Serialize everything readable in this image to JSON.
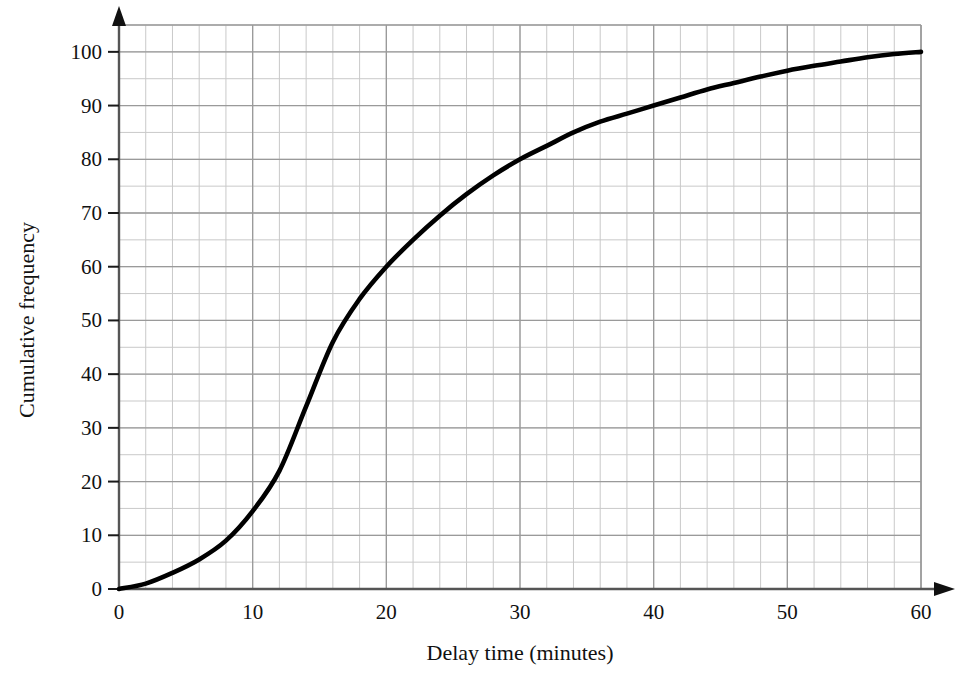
{
  "chart_data": {
    "type": "line",
    "title": "",
    "subtitle": "",
    "xlabel": "Delay time (minutes)",
    "ylabel": "Cumulative frequency",
    "xlim": [
      0,
      60
    ],
    "ylim": [
      0,
      105
    ],
    "x_major_ticks": [
      0,
      10,
      20,
      30,
      40,
      50,
      60
    ],
    "x_major_tick_labels": [
      "0",
      "10",
      "20",
      "30",
      "40",
      "50",
      "60"
    ],
    "y_major_ticks": [
      0,
      10,
      20,
      30,
      40,
      50,
      60,
      70,
      80,
      90,
      100
    ],
    "y_major_tick_labels": [
      "0",
      "10",
      "20",
      "30",
      "40",
      "50",
      "60",
      "70",
      "80",
      "90",
      "100"
    ],
    "x_minor_step": 2,
    "y_minor_step": 5,
    "grid": true,
    "grid_color": "#9a9a9a",
    "minor_grid_color": "#c9c9c9",
    "axis_color": "#1a1a1a",
    "series_color": "#000000",
    "legend": null,
    "legend_position": "none",
    "annotations": [],
    "series": [
      {
        "name": "Cumulative frequency",
        "x": [
          0,
          2,
          4,
          6,
          8,
          10,
          12,
          14,
          16,
          18,
          20,
          22,
          24,
          26,
          28,
          30,
          32,
          34,
          36,
          38,
          40,
          42,
          44,
          46,
          48,
          50,
          52,
          54,
          56,
          58,
          60
        ],
        "values": [
          0,
          1,
          3,
          5.5,
          9,
          14.5,
          22,
          34,
          46,
          54,
          60,
          65,
          69.5,
          73.5,
          77,
          80,
          82.5,
          85,
          87,
          88.5,
          90,
          91.5,
          93,
          94.2,
          95.4,
          96.5,
          97.4,
          98.2,
          99,
          99.6,
          100
        ]
      }
    ],
    "key_readings": [
      {
        "x": 0,
        "y": 0
      },
      {
        "x": 10,
        "y": 14.5
      },
      {
        "x": 20,
        "y": 60
      },
      {
        "x": 30,
        "y": 80
      },
      {
        "x": 40,
        "y": 90
      },
      {
        "x": 50,
        "y": 96.5
      },
      {
        "x": 60,
        "y": 100
      }
    ]
  },
  "plot_geometry": {
    "left_px": 119,
    "right_px": 921,
    "top_px": 25,
    "bottom_px": 589,
    "x_unit_px": 12.95,
    "y_unit_px": 5.36
  }
}
